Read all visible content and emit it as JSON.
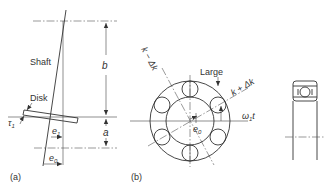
{
  "figure": {
    "panel_a": {
      "label": "(a)",
      "shaft_label": "Shaft",
      "disk_label": "Disk",
      "tau_label": "τ",
      "tau_sub": "1",
      "e1_label": "e",
      "e1_sub": "1",
      "e0_label": "e",
      "e0_sub": "0",
      "dim_b": "b",
      "dim_a": "a"
    },
    "panel_b": {
      "label": "(b)",
      "large_label": "Large",
      "k_plus_label": "k + Δk",
      "k_minus_label": "k − Δk",
      "omega_label": "ω",
      "omega_sub": "1",
      "omega_t": "t",
      "e0_label": "e",
      "e0_sub": "0",
      "ball_count": 6
    },
    "panel_c": {
      "description": "bearing cross-section"
    },
    "colors": {
      "line": "#333333",
      "background": "#ffffff"
    }
  }
}
